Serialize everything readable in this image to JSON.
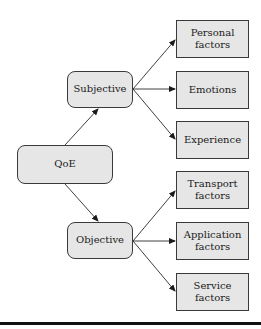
{
  "diagram": {
    "root": {
      "label": "QoE"
    },
    "branches": [
      {
        "label": "Subjective",
        "children": [
          {
            "label": "Personal factors"
          },
          {
            "label": "Emotions"
          },
          {
            "label": "Experience"
          }
        ]
      },
      {
        "label": "Objective",
        "children": [
          {
            "label": "Transport factors"
          },
          {
            "label": "Application factors"
          },
          {
            "label": "Service factors"
          }
        ]
      }
    ],
    "colors": {
      "node_fill": "#e6e6e6",
      "stroke": "#3a3a3a",
      "rule": "#111111"
    }
  }
}
